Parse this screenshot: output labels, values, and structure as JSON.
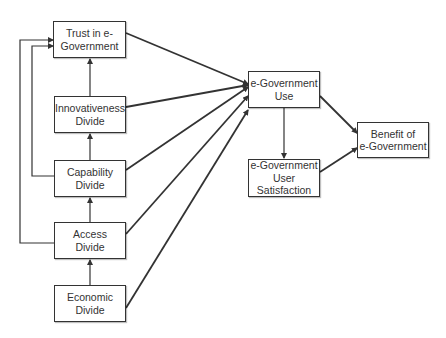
{
  "nodes": {
    "trust": {
      "label": "Trust in e-\nGovernment",
      "x": 53,
      "y": 21,
      "w": 73,
      "h": 37
    },
    "innovativeness": {
      "label": "Innovativeness\nDivide",
      "x": 54,
      "y": 96,
      "w": 72,
      "h": 37
    },
    "capability": {
      "label": "Capability\nDivide",
      "x": 54,
      "y": 160,
      "w": 72,
      "h": 37
    },
    "access": {
      "label": "Access\nDivide",
      "x": 54,
      "y": 222,
      "w": 72,
      "h": 37
    },
    "economic": {
      "label": "Economic\nDivide",
      "x": 54,
      "y": 285,
      "w": 72,
      "h": 37
    },
    "use": {
      "label": "e-Government\nUse",
      "x": 248,
      "y": 71,
      "w": 72,
      "h": 37
    },
    "satisfaction": {
      "label": "e-Government\nUser\nSatisfaction",
      "x": 248,
      "y": 159,
      "w": 72,
      "h": 38
    },
    "benefit": {
      "label": "Benefit of\ne-Government",
      "x": 357,
      "y": 122,
      "w": 72,
      "h": 36
    }
  },
  "edges": [
    {
      "from": "economic",
      "to": "access"
    },
    {
      "from": "access",
      "to": "capability"
    },
    {
      "from": "capability",
      "to": "innovativeness"
    },
    {
      "from": "innovativeness",
      "to": "trust"
    },
    {
      "from": "access",
      "to": "trust",
      "routing": "outer-loop-left"
    },
    {
      "from": "capability",
      "to": "trust",
      "routing": "inner-loop-left"
    },
    {
      "from": "trust",
      "to": "use"
    },
    {
      "from": "innovativeness",
      "to": "use"
    },
    {
      "from": "capability",
      "to": "use"
    },
    {
      "from": "access",
      "to": "use"
    },
    {
      "from": "economic",
      "to": "use"
    },
    {
      "from": "use",
      "to": "satisfaction"
    },
    {
      "from": "use",
      "to": "benefit"
    },
    {
      "from": "satisfaction",
      "to": "benefit"
    }
  ],
  "colors": {
    "stroke": "#333333",
    "text": "#333333",
    "background": "#ffffff"
  }
}
